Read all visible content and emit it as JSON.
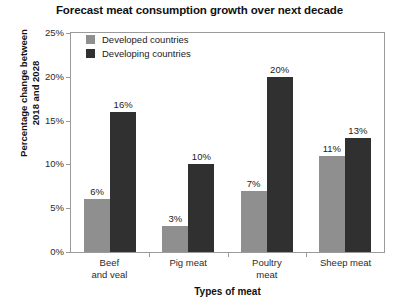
{
  "chart_data": {
    "type": "bar",
    "title": "Forecast meat consumption growth over next decade",
    "xlabel": "Types of meat",
    "ylabel_lines": [
      "Percentage change between",
      "2018 and 2028"
    ],
    "categories": [
      "Beef and veal",
      "Pig meat",
      "Poultry meat",
      "Sheep meat"
    ],
    "category_lines": [
      [
        "Beef",
        "and veal"
      ],
      [
        "Pig meat"
      ],
      [
        "Poultry",
        "meat"
      ],
      [
        "Sheep meat"
      ]
    ],
    "series": [
      {
        "name": "Developed countries",
        "color": "#8f8f8f",
        "values": [
          6,
          3,
          7,
          11
        ],
        "labels": [
          "6%",
          "3%",
          "7%",
          "11%"
        ]
      },
      {
        "name": "Developing countries",
        "color": "#303030",
        "values": [
          16,
          10,
          20,
          13
        ],
        "labels": [
          "16%",
          "10%",
          "20%",
          "13%"
        ]
      }
    ],
    "ylim": [
      0,
      25
    ],
    "ytick_values": [
      0,
      5,
      10,
      15,
      20,
      25
    ],
    "ytick_labels": [
      "0%",
      "5%",
      "10%",
      "15%",
      "20%",
      "25%"
    ],
    "grid": false,
    "legend_position": "top-left-inside",
    "frame_color": "#9a9a9a",
    "background": "#ffffff"
  }
}
